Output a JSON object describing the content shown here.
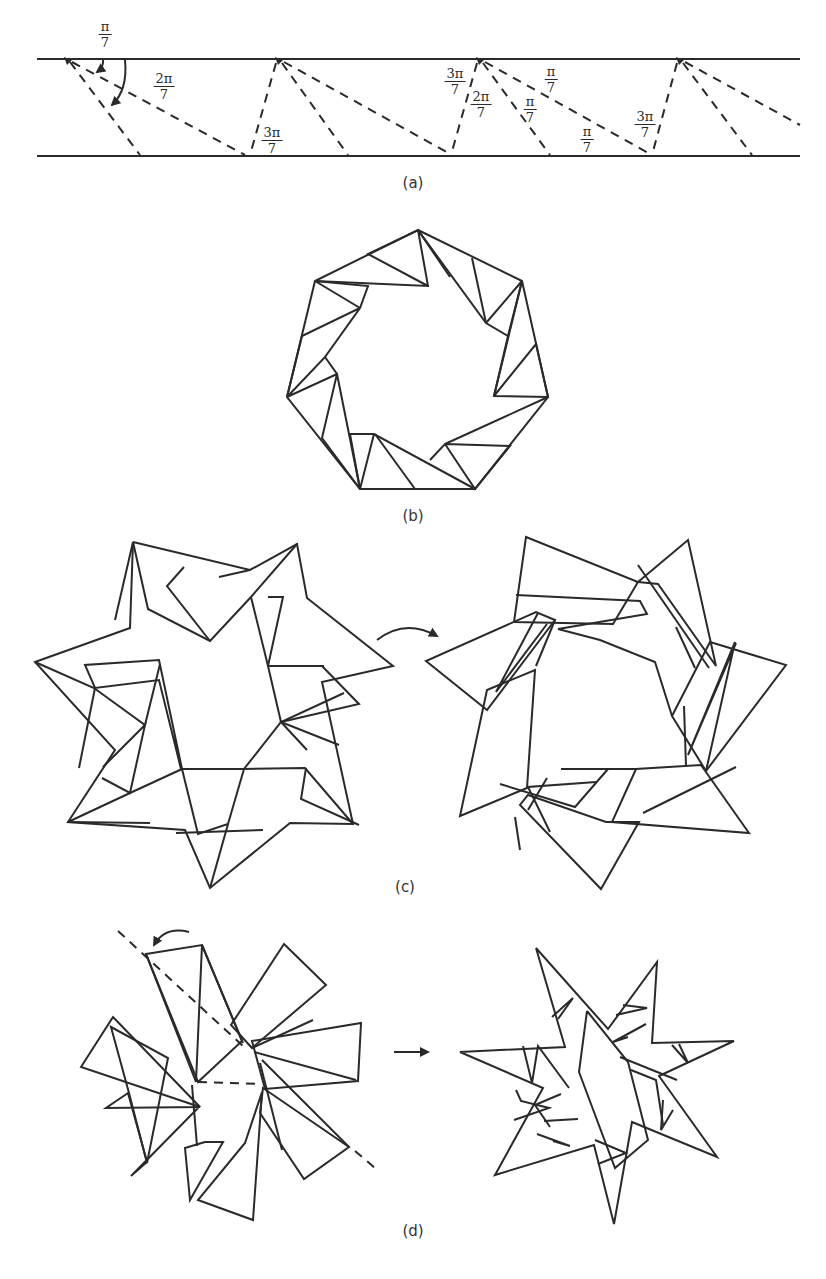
{
  "figure": {
    "panels": [
      {
        "id": "a",
        "caption": "(a)",
        "description": "Paper strip with dashed crease lines at angles of multiples of pi/7"
      },
      {
        "id": "b",
        "caption": "(b)",
        "description": "Strip folded into a heptagonal ring"
      },
      {
        "id": "c",
        "caption": "(c)",
        "description": "Seven-pointed star folding, before and after rotating the flaps"
      },
      {
        "id": "d",
        "caption": "(d)",
        "description": "Flaps folded along dashed line producing a seven-pointed star"
      }
    ],
    "angle_labels": [
      {
        "num": "π",
        "den": "7"
      },
      {
        "num": "2π",
        "den": "7"
      },
      {
        "num": "3π",
        "den": "7"
      },
      {
        "num": "3π",
        "den": "7"
      },
      {
        "num": "2π",
        "den": "7"
      },
      {
        "num": "π",
        "den": "7"
      },
      {
        "num": "π",
        "den": "7"
      },
      {
        "num": "π",
        "den": "7"
      },
      {
        "num": "3π",
        "den": "7"
      }
    ],
    "arrows": [
      {
        "name": "curved-arrow-c",
        "meaning": "rotate/transform"
      },
      {
        "name": "straight-arrow-d",
        "meaning": "results in"
      }
    ],
    "colors": {
      "line": "#2a2a2a",
      "background": "#ffffff"
    }
  }
}
